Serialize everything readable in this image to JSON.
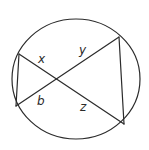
{
  "diagram": {
    "type": "intersecting-chords-in-circle",
    "stroke_color": "#2b2b2b",
    "background": "#ffffff",
    "circle": {
      "cx": 76,
      "cy": 79,
      "rx": 64,
      "ry": 60
    },
    "points": {
      "top_left": {
        "x": 19,
        "y": 54
      },
      "bottom_left": {
        "x": 16,
        "y": 106
      },
      "top_right": {
        "x": 119,
        "y": 37
      },
      "bottom_right": {
        "x": 124,
        "y": 124
      },
      "intersection": {
        "x": 56,
        "y": 79
      }
    },
    "labels": [
      {
        "id": "x",
        "text": "x",
        "x": 38,
        "y": 63
      },
      {
        "id": "y",
        "text": "y",
        "x": 79,
        "y": 54
      },
      {
        "id": "b",
        "text": "b",
        "x": 37,
        "y": 105
      },
      {
        "id": "z",
        "text": "z",
        "x": 80,
        "y": 111
      }
    ]
  }
}
